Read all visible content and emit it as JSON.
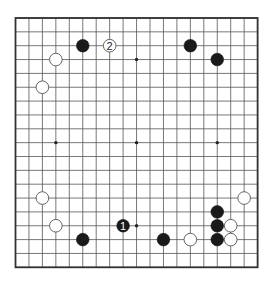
{
  "board": {
    "size": 19,
    "origin": {
      "x": 15.5,
      "y": 18
    },
    "spacing": {
      "x": 13.45,
      "y": 13.85
    },
    "line_color": "#555555",
    "border_color": "#333333",
    "star_points": [
      [
        3,
        3
      ],
      [
        9,
        3
      ],
      [
        15,
        3
      ],
      [
        3,
        9
      ],
      [
        9,
        9
      ],
      [
        15,
        9
      ],
      [
        3,
        15
      ],
      [
        9,
        15
      ],
      [
        15,
        15
      ]
    ]
  },
  "stones": [
    {
      "color": "black",
      "x": 5,
      "y": 2
    },
    {
      "color": "white",
      "x": 7,
      "y": 2,
      "label": "2"
    },
    {
      "color": "black",
      "x": 13,
      "y": 2
    },
    {
      "color": "black",
      "x": 15,
      "y": 3
    },
    {
      "color": "white",
      "x": 3,
      "y": 3
    },
    {
      "color": "white",
      "x": 2,
      "y": 5
    },
    {
      "color": "white",
      "x": 2,
      "y": 13
    },
    {
      "color": "white",
      "x": 3,
      "y": 15
    },
    {
      "color": "black",
      "x": 5,
      "y": 16
    },
    {
      "color": "black",
      "x": 8,
      "y": 15,
      "label": "1"
    },
    {
      "color": "black",
      "x": 11,
      "y": 16
    },
    {
      "color": "white",
      "x": 13,
      "y": 16
    },
    {
      "color": "black",
      "x": 15,
      "y": 14
    },
    {
      "color": "black",
      "x": 15,
      "y": 15
    },
    {
      "color": "black",
      "x": 15,
      "y": 16
    },
    {
      "color": "white",
      "x": 16,
      "y": 15
    },
    {
      "color": "white",
      "x": 16,
      "y": 16
    },
    {
      "color": "white",
      "x": 17,
      "y": 13
    }
  ]
}
